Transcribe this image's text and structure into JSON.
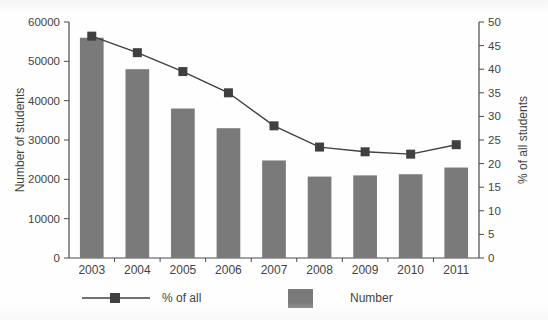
{
  "chart_data": {
    "type": "bar",
    "title": "",
    "xlabel": "",
    "ylabel": "Number of students",
    "y2label": "% of all students",
    "categories": [
      "2003",
      "2004",
      "2005",
      "2006",
      "2007",
      "2008",
      "2009",
      "2010",
      "2011"
    ],
    "series": [
      {
        "name": "Number",
        "type": "bar",
        "axis": "left",
        "color": "#7a7a7a",
        "values": [
          56000,
          48000,
          38000,
          33000,
          24800,
          20700,
          21000,
          21300,
          23000
        ]
      },
      {
        "name": "% of all",
        "type": "line",
        "axis": "right",
        "color": "#404040",
        "values": [
          47,
          43.5,
          39.5,
          35,
          28,
          23.5,
          22.5,
          22,
          24
        ]
      }
    ],
    "ylim": [
      0,
      60000
    ],
    "yticks": [
      "0",
      "10000",
      "20000",
      "30000",
      "40000",
      "50000",
      "60000"
    ],
    "y2lim": [
      0,
      50
    ],
    "y2ticks": [
      "0",
      "5",
      "10",
      "15",
      "20",
      "25",
      "30",
      "35",
      "40",
      "45",
      "50"
    ],
    "grid": false,
    "legend_position": "bottom"
  },
  "legend": {
    "line_entry": "% of all",
    "bar_entry": "Number"
  },
  "colors": {
    "bar": "#7a7a7a",
    "line": "#404040",
    "axis": "#4a4a4a",
    "text": "#434343",
    "background": "#fefefe"
  }
}
